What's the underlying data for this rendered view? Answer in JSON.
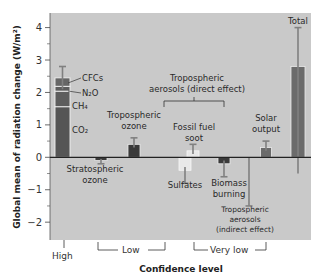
{
  "chart_data": {
    "type": "bar",
    "title": "",
    "xlabel": "Confidence level",
    "ylabel": "Global mean of radiation change (W/m²)",
    "ylim": [
      -2.55,
      4.45
    ],
    "yticks": [
      -2,
      -1,
      0,
      1,
      2,
      3,
      4
    ],
    "ytick_labels": [
      "−2",
      "−1",
      "0",
      "1",
      "2",
      "3",
      "4"
    ],
    "grid": false,
    "colors": {
      "plot_bg": "#c9c9c9",
      "bar_dark": "#3a3a3a",
      "bar_mid": "#6b6b6b",
      "bar_light": "#e8e8e8",
      "error": "#808080",
      "axis": "#222222"
    },
    "stacked_bar": {
      "name": "Greenhouse gases",
      "segments": [
        {
          "label": "CO2",
          "label_display": "CO₂",
          "from": 0,
          "to": 1.56
        },
        {
          "label": "CH4",
          "label_display": "CH₄",
          "from": 1.56,
          "to": 2.04
        },
        {
          "label": "N2O",
          "label_display": "N₂O",
          "from": 2.04,
          "to": 2.19
        },
        {
          "label": "CFCs",
          "label_display": "CFCs",
          "from": 2.19,
          "to": 2.45
        }
      ],
      "error": [
        2.1,
        2.8
      ],
      "confidence": "High"
    },
    "bars": [
      {
        "name": "Stratospheric ozone",
        "value": -0.1,
        "error": [
          -0.05,
          -0.2
        ],
        "confidence": "Low",
        "style": "dark"
      },
      {
        "name": "Tropospheric ozone",
        "value": 0.4,
        "error": [
          0.3,
          0.6
        ],
        "confidence": "Low",
        "style": "dark"
      },
      {
        "name": "Sulfates",
        "value": -0.4,
        "error": [
          -0.3,
          -0.8
        ],
        "confidence": "Low",
        "style": "light"
      },
      {
        "name": "Fossil fuel soot",
        "value": 0.2,
        "error": [
          0.1,
          0.4
        ],
        "confidence": "Low",
        "style": "light"
      },
      {
        "name": "Biomass burning",
        "value": -0.2,
        "error": [
          -0.1,
          -0.6
        ],
        "confidence": "Very low",
        "style": "dark"
      },
      {
        "name": "Tropospheric aerosols (indirect effect)",
        "value": null,
        "error": [
          0,
          -1.5
        ],
        "confidence": "Very low",
        "style": "line"
      },
      {
        "name": "Solar output",
        "value": 0.3,
        "error": [
          0.2,
          0.5
        ],
        "confidence": "Very low",
        "style": "mid"
      },
      {
        "name": "Total",
        "value": 2.8,
        "error": [
          -0.5,
          4.0
        ],
        "confidence": "",
        "style": "mid"
      }
    ],
    "annotations": {
      "cfcs": "CFCs",
      "n2o": "N₂O",
      "ch4": "CH₄",
      "co2": "CO₂",
      "strat_ozone_1": "Stratospheric",
      "strat_ozone_2": "ozone",
      "trop_ozone_1": "Tropospheric",
      "trop_ozone_2": "ozone",
      "trop_aerosols_direct_1": "Tropospheric",
      "trop_aerosols_direct_2": "aerosols (direct effect)",
      "fossil_1": "Fossil fuel",
      "fossil_2": "soot",
      "sulfates": "Sulfates",
      "biomass_1": "Biomass",
      "biomass_2": "burning",
      "indirect_1": "Tropospheric",
      "indirect_2": "aerosols",
      "indirect_3": "(indirect effect)",
      "solar_1": "Solar",
      "solar_2": "output",
      "total": "Total"
    },
    "confidence_levels": [
      "High",
      "Low",
      "Very low"
    ]
  }
}
